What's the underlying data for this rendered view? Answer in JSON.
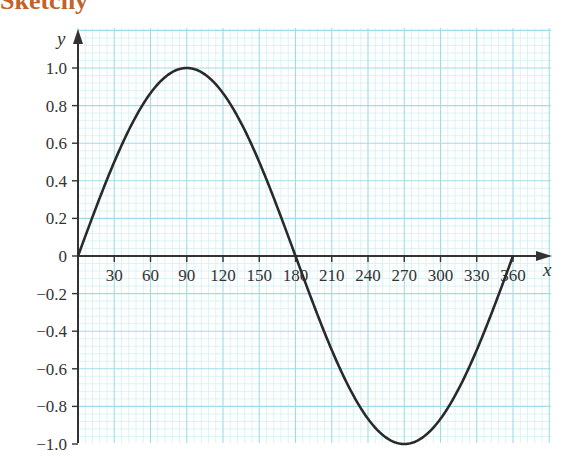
{
  "header": {
    "title_fragment": "Sketchy"
  },
  "chart_data": {
    "type": "line",
    "title": "",
    "xlabel": "x",
    "ylabel": "y",
    "x_ticks": [
      30,
      60,
      90,
      120,
      150,
      180,
      210,
      240,
      270,
      300,
      330,
      360
    ],
    "y_ticks": [
      "-1.0",
      "-0.8",
      "-0.6",
      "-0.4",
      "-0.2",
      "0",
      "0.2",
      "0.4",
      "0.6",
      "0.8",
      "1.0"
    ],
    "xlim": [
      0,
      375
    ],
    "ylim": [
      -1.0,
      1.0
    ],
    "grid": true,
    "series": [
      {
        "name": "y = sin x",
        "x": [
          0,
          30,
          60,
          90,
          120,
          150,
          180,
          210,
          240,
          270,
          300,
          330,
          360
        ],
        "values": [
          0,
          0.5,
          0.866,
          1.0,
          0.866,
          0.5,
          0,
          -0.5,
          -0.866,
          -1.0,
          -0.866,
          -0.5,
          0
        ]
      }
    ],
    "colors": {
      "grid_major": "#9fdde6",
      "grid_minor": "#d3f0f4",
      "curve": "#2a2a2a",
      "axis": "#333333"
    }
  }
}
